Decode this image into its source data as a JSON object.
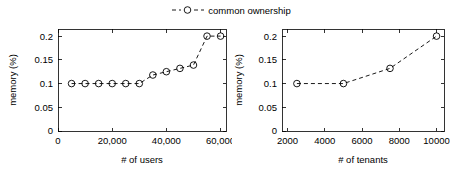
{
  "legend": {
    "position": "top-center",
    "entries": [
      {
        "label": "common ownership",
        "marker": "circle-open",
        "linestyle": "dashed",
        "color": "#000000"
      }
    ]
  },
  "chart_data": [
    {
      "type": "line",
      "panel": "left",
      "title": "",
      "xlabel": "# of users",
      "ylabel": "memory (%)",
      "xlim": [
        0,
        62000
      ],
      "ylim": [
        0,
        0.215
      ],
      "grid": false,
      "xticks": [
        0,
        20000,
        40000,
        60000
      ],
      "xticklabels": [
        "0",
        "20,000",
        "40,000",
        "60,000"
      ],
      "yticks": [
        0,
        0.05,
        0.1,
        0.15,
        0.2
      ],
      "yticklabels": [
        "0",
        "0.05",
        "0.1",
        "0.15",
        "0.2"
      ],
      "series": [
        {
          "name": "common ownership",
          "marker": "circle-open",
          "linestyle": "dashed",
          "color": "#000000",
          "x": [
            5000,
            10000,
            15000,
            20000,
            25000,
            30000,
            35000,
            40000,
            45000,
            50000,
            55000,
            60000
          ],
          "values": [
            0.1,
            0.1,
            0.1,
            0.1,
            0.1,
            0.1,
            0.118,
            0.125,
            0.132,
            0.139,
            0.2,
            0.2
          ]
        }
      ]
    },
    {
      "type": "line",
      "panel": "right",
      "title": "",
      "xlabel": "# of tenants",
      "ylabel": "memory (%)",
      "xlim": [
        1700,
        10400
      ],
      "ylim": [
        0,
        0.215
      ],
      "grid": false,
      "xticks": [
        2000,
        4000,
        6000,
        8000,
        10000
      ],
      "xticklabels": [
        "2000",
        "4000",
        "6000",
        "8000",
        "10000"
      ],
      "yticks": [
        0,
        0.05,
        0.1,
        0.15,
        0.2
      ],
      "yticklabels": [
        "0",
        "0.05",
        "0.1",
        "0.15",
        "0.2"
      ],
      "series": [
        {
          "name": "common ownership",
          "marker": "circle-open",
          "linestyle": "dashed",
          "color": "#000000",
          "x": [
            2500,
            5000,
            7500,
            10000
          ],
          "values": [
            0.1,
            0.1,
            0.132,
            0.2
          ]
        }
      ]
    }
  ]
}
